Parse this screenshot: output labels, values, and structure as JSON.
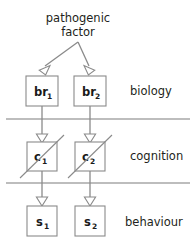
{
  "diagram": {
    "title": {
      "line1": "pathogenic",
      "line2": "factor"
    },
    "layers": [
      {
        "name": "biology-layer",
        "label": "biology"
      },
      {
        "name": "cognition-layer",
        "label": "cognition"
      },
      {
        "name": "behaviour-layer",
        "label": "behaviour"
      }
    ],
    "nodes": [
      {
        "name": "node-br1",
        "base": "br",
        "sub": "1",
        "layer": "biology",
        "column": 1,
        "slashed": false
      },
      {
        "name": "node-br2",
        "base": "br",
        "sub": "2",
        "layer": "biology",
        "column": 2,
        "slashed": false
      },
      {
        "name": "node-c1",
        "base": "c",
        "sub": "1",
        "layer": "cognition",
        "column": 1,
        "slashed": true
      },
      {
        "name": "node-c2",
        "base": "c",
        "sub": "2",
        "layer": "cognition",
        "column": 2,
        "slashed": true
      },
      {
        "name": "node-s1",
        "base": "s",
        "sub": "1",
        "layer": "behaviour",
        "column": 1,
        "slashed": false
      },
      {
        "name": "node-s2",
        "base": "s",
        "sub": "2",
        "layer": "behaviour",
        "column": 2,
        "slashed": false
      }
    ],
    "edges": [
      {
        "name": "edge-factor-to-br1",
        "from": "pathogenic factor",
        "to": "br1",
        "style": "branch-arrow"
      },
      {
        "name": "edge-factor-to-br2",
        "from": "pathogenic factor",
        "to": "br2",
        "style": "branch-arrow"
      },
      {
        "name": "edge-br1-to-c1",
        "from": "br1",
        "to": "c1",
        "style": "vertical-arrow"
      },
      {
        "name": "edge-br2-to-c2",
        "from": "br2",
        "to": "c2",
        "style": "vertical-arrow"
      },
      {
        "name": "edge-c1-to-s1",
        "from": "c1",
        "to": "s1",
        "style": "vertical-arrow"
      },
      {
        "name": "edge-c2-to-s2",
        "from": "c2",
        "to": "s2",
        "style": "vertical-arrow"
      }
    ],
    "colors": {
      "background": "#ffffff",
      "stroke": "#8a8a8a",
      "divider": "#7d7d7d",
      "text": "#231f20"
    }
  }
}
